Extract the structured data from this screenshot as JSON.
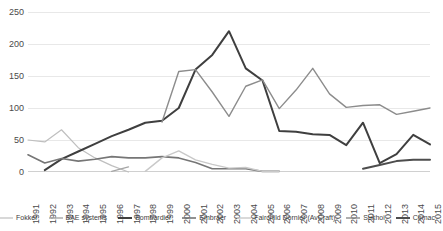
{
  "chart_data": {
    "type": "line",
    "title": "",
    "xlabel": "",
    "ylabel": "",
    "ylim": [
      0,
      250
    ],
    "yticks": [
      0,
      50,
      100,
      150,
      200,
      250
    ],
    "grid": true,
    "legend_position": "bottom",
    "categories": [
      "1991",
      "1992",
      "1993",
      "1994",
      "1995",
      "1996",
      "1997",
      "1998",
      "1999",
      "2000",
      "2001",
      "2002",
      "2003",
      "2004",
      "2005",
      "2006",
      "2007",
      "2008",
      "2009",
      "2010",
      "2011",
      "2012",
      "2013",
      "2014",
      "2015"
    ],
    "series": [
      {
        "name": "Fokker",
        "color": "#bfbfbf",
        "width": 1.2,
        "values": [
          50,
          47,
          66,
          38,
          22,
          10,
          0,
          null,
          null,
          null,
          null,
          null,
          null,
          null,
          null,
          null,
          null,
          null,
          null,
          null,
          null,
          null,
          null,
          null,
          null
        ]
      },
      {
        "name": "BAE systems",
        "color": "#a6a6a6",
        "width": 1.4,
        "values": [
          null,
          null,
          null,
          null,
          null,
          1,
          8,
          null,
          null,
          null,
          null,
          null,
          null,
          null,
          null,
          null,
          null,
          null,
          null,
          null,
          null,
          null,
          null,
          null,
          null
        ]
      },
      {
        "name": "Bombardier",
        "color": "#3f3f3f",
        "width": 2.0,
        "values": [
          null,
          3,
          20,
          32,
          44,
          56,
          66,
          77,
          80,
          100,
          160,
          183,
          220,
          162,
          143,
          64,
          63,
          59,
          58,
          42,
          77,
          14,
          28,
          58,
          43
        ]
      },
      {
        "name": "Embraer",
        "color": "#767676",
        "width": 1.6,
        "values": [
          27,
          14,
          21,
          17,
          20,
          24,
          22,
          22,
          24,
          22,
          15,
          5,
          5,
          5,
          1,
          1,
          null,
          null,
          null,
          null,
          null,
          null,
          null,
          null,
          null
        ]
      },
      {
        "name": "Fairchild Dornier (AvCraft)",
        "color": "#c9c9c9",
        "width": 1.4,
        "values": [
          null,
          null,
          null,
          null,
          null,
          null,
          null,
          1,
          22,
          33,
          19,
          12,
          6,
          7,
          1,
          1,
          null,
          null,
          null,
          null,
          null,
          null,
          null,
          null,
          null
        ]
      },
      {
        "name": "Sukhoi",
        "color": "#8c8c8c",
        "width": 1.4,
        "values": [
          null,
          null,
          null,
          null,
          null,
          null,
          null,
          null,
          78,
          157,
          160,
          125,
          87,
          134,
          144,
          99,
          128,
          162,
          122,
          101,
          104,
          105,
          90,
          95,
          100
        ]
      },
      {
        "name": "Comac",
        "color": "#4d4d4d",
        "width": 2.0,
        "values": [
          null,
          null,
          null,
          null,
          null,
          null,
          null,
          null,
          null,
          null,
          null,
          null,
          null,
          null,
          null,
          null,
          null,
          null,
          null,
          null,
          5,
          11,
          17,
          19,
          19
        ]
      }
    ]
  }
}
